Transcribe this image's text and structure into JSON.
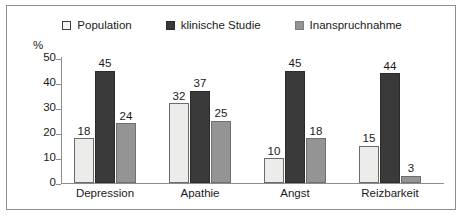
{
  "chart_data": {
    "type": "bar",
    "title": "",
    "xlabel": "",
    "ylabel": "%",
    "ylim": [
      0,
      50
    ],
    "yticks": [
      0,
      10,
      20,
      30,
      40,
      50
    ],
    "grid": false,
    "legend_position": "top-center",
    "categories": [
      "Depression",
      "Apathie",
      "Angst",
      "Reizbarkeit"
    ],
    "series": [
      {
        "name": "Population",
        "color": "#ececeb",
        "values": [
          18,
          32,
          10,
          15
        ]
      },
      {
        "name": "klinische Studie",
        "color": "#3a3a3a",
        "values": [
          45,
          37,
          45,
          44
        ]
      },
      {
        "name": "Inanspruchnahme",
        "color": "#949494",
        "values": [
          24,
          25,
          18,
          3
        ]
      }
    ]
  },
  "axis": {
    "unit_label": "%",
    "tick_labels": [
      "50",
      "40",
      "30",
      "20",
      "10",
      "0"
    ]
  },
  "legend": {
    "items": [
      {
        "label": "Population"
      },
      {
        "label": "klinische Studie"
      },
      {
        "label": "Inanspruchnahme"
      }
    ]
  }
}
